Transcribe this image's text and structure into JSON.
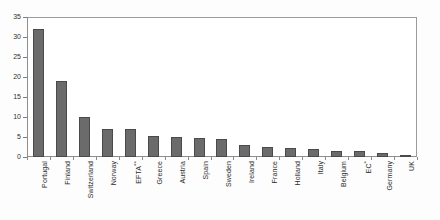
{
  "chart_data": {
    "type": "bar",
    "title": "",
    "subtitle": "",
    "xlabel": "",
    "ylabel": "",
    "ylim": [
      0,
      35
    ],
    "yticks": [
      "0",
      "5",
      "10",
      "15",
      "20",
      "25",
      "30",
      "35"
    ],
    "ytick_values": [
      0,
      5,
      10,
      15,
      20,
      25,
      30,
      35
    ],
    "grid": false,
    "legend": null,
    "bar_color": "#6b6b6b",
    "bar_edge_color": "#4a4a4a",
    "frame_color": "#8e8e8e",
    "categories": [
      "Portugal",
      "Finland",
      "Switzerland",
      "Norway",
      "EFTA**",
      "Greece",
      "Austria",
      "Spain",
      "Sweden",
      "Ireland",
      "France",
      "Holland",
      "Italy",
      "Belgium",
      "EC*",
      "Germany",
      "UK"
    ],
    "values": [
      32,
      19,
      10,
      7,
      7,
      5.2,
      5,
      4.8,
      4.5,
      3,
      2.5,
      2.2,
      2,
      1.5,
      1.5,
      1,
      0.3
    ],
    "annotations": [
      "EFTA** footnote marker",
      "EC* footnote marker"
    ]
  }
}
